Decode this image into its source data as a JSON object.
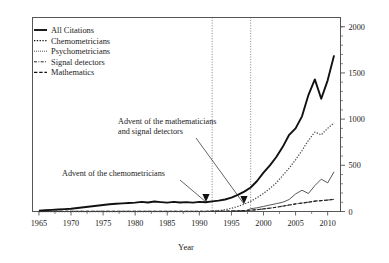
{
  "chart_data": {
    "type": "line",
    "title": "",
    "xlabel": "Year",
    "ylabel": "",
    "xlim": [
      1964,
      2012
    ],
    "ylim": [
      0,
      2100
    ],
    "grid": false,
    "y_axis_position": "right",
    "xticks": [
      1965,
      1970,
      1975,
      1980,
      1985,
      1990,
      1995,
      2000,
      2005,
      2010
    ],
    "xtick_labels": [
      "1965",
      "1970",
      "1975",
      "1980",
      "1985",
      "1990",
      "1995",
      "2000",
      "2005",
      "2010"
    ],
    "yticks": [
      0,
      500,
      1000,
      1500,
      2000
    ],
    "ytick_labels": [
      "0",
      "500",
      "1000",
      "1500",
      "2000"
    ],
    "yticks_minor": [
      100,
      200,
      300,
      400,
      600,
      700,
      800,
      900,
      1100,
      1200,
      1300,
      1400,
      1600,
      1700,
      1800,
      1900,
      2000
    ],
    "legend_position": "top-left",
    "x": [
      1965,
      1966,
      1967,
      1968,
      1969,
      1970,
      1971,
      1972,
      1973,
      1974,
      1975,
      1976,
      1977,
      1978,
      1979,
      1980,
      1981,
      1982,
      1983,
      1984,
      1985,
      1986,
      1987,
      1988,
      1989,
      1990,
      1991,
      1992,
      1993,
      1994,
      1995,
      1996,
      1997,
      1998,
      1999,
      2000,
      2001,
      2002,
      2003,
      2004,
      2005,
      2006,
      2007,
      2008,
      2009,
      2010,
      2011
    ],
    "series": [
      {
        "name": "All Citations",
        "style": "solid-thick",
        "color": "#111111",
        "values": [
          10,
          14,
          18,
          22,
          26,
          30,
          38,
          46,
          54,
          62,
          70,
          78,
          84,
          88,
          92,
          96,
          104,
          98,
          108,
          102,
          96,
          104,
          98,
          102,
          96,
          104,
          100,
          110,
          118,
          130,
          150,
          180,
          215,
          260,
          330,
          420,
          500,
          590,
          700,
          830,
          900,
          1030,
          1260,
          1430,
          1220,
          1420,
          1690
        ]
      },
      {
        "name": "Chemometricians",
        "style": "dotted",
        "color": "#4a4a4a",
        "values": [
          0,
          0,
          0,
          0,
          0,
          0,
          0,
          0,
          0,
          0,
          0,
          0,
          0,
          0,
          0,
          0,
          0,
          0,
          0,
          0,
          0,
          0,
          0,
          0,
          0,
          0,
          0,
          4,
          10,
          20,
          35,
          55,
          80,
          110,
          150,
          195,
          250,
          310,
          390,
          470,
          560,
          660,
          770,
          860,
          830,
          900,
          960
        ]
      },
      {
        "name": "Psychometricians",
        "style": "solid-thin",
        "color": "#3a3a3a",
        "values": [
          0,
          0,
          0,
          0,
          0,
          0,
          0,
          0,
          0,
          0,
          0,
          0,
          0,
          0,
          0,
          0,
          0,
          0,
          0,
          0,
          0,
          0,
          0,
          0,
          0,
          0,
          0,
          0,
          0,
          0,
          0,
          0,
          0,
          30,
          40,
          55,
          70,
          85,
          100,
          130,
          190,
          230,
          195,
          280,
          350,
          310,
          430
        ]
      },
      {
        "name": "Signal detectors",
        "style": "dash-dot",
        "color": "#333333",
        "values": [
          2,
          2,
          2,
          2,
          2,
          2,
          2,
          2,
          2,
          2,
          2,
          2,
          2,
          2,
          2,
          2,
          2,
          2,
          2,
          2,
          2,
          2,
          2,
          2,
          2,
          2,
          2,
          3,
          4,
          5,
          6,
          8,
          10,
          14,
          20,
          28,
          36,
          46,
          58,
          70,
          82,
          92,
          100,
          112,
          118,
          124,
          132
        ]
      },
      {
        "name": "Mathematics",
        "style": "dashed",
        "color": "#222222",
        "values": [
          2,
          2,
          2,
          2,
          2,
          2,
          2,
          2,
          2,
          2,
          2,
          2,
          2,
          2,
          2,
          2,
          2,
          2,
          2,
          2,
          2,
          2,
          2,
          2,
          2,
          2,
          2,
          3,
          4,
          5,
          6,
          8,
          10,
          14,
          20,
          28,
          36,
          46,
          58,
          70,
          82,
          92,
          100,
          112,
          118,
          124,
          132
        ]
      }
    ],
    "reference_lines": [
      {
        "x": 1992,
        "style": "dotted",
        "label": "advent-chemometricians"
      },
      {
        "x": 1998,
        "style": "dotted",
        "label": "advent-mathematicians-signal-detectors"
      }
    ],
    "annotations": [
      {
        "id": "annotation-mathematicians",
        "lines": [
          "Advent of the mathematicians",
          "and signal detectors"
        ],
        "text_x": 118,
        "text_y": 124,
        "arrow_from_x": 196,
        "arrow_from_y": 138,
        "arrow_to_x": 244,
        "arrow_to_y": 204
      },
      {
        "id": "annotation-chemometricians",
        "lines": [
          "Advent of the chemometricians"
        ],
        "text_x": 62,
        "text_y": 176,
        "arrow_from_x": 180,
        "arrow_from_y": 180,
        "arrow_to_x": 206,
        "arrow_to_y": 202
      }
    ]
  },
  "legend": {
    "items": [
      {
        "label": "All Citations",
        "style": "solid-thick"
      },
      {
        "label": "Chemometricians",
        "style": "dotted"
      },
      {
        "label": "Psychometricians",
        "style": "fine-dotted"
      },
      {
        "label": "Signal detectors",
        "style": "dash-dot"
      },
      {
        "label": "Mathematics",
        "style": "dashed"
      }
    ]
  }
}
